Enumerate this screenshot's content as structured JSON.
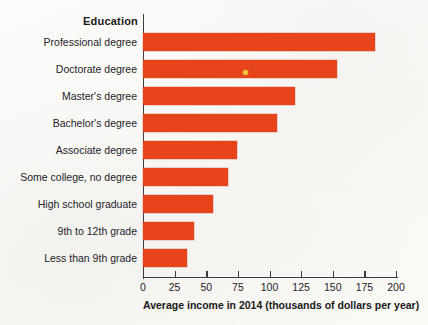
{
  "chart_data": {
    "type": "bar",
    "orientation": "horizontal",
    "title": "",
    "category_axis_header": "Education",
    "xlabel": "Average income in 2014 (thousands of dollars per year)",
    "ylabel": "Education",
    "xlim": [
      0,
      200
    ],
    "xticks": [
      0,
      25,
      50,
      75,
      100,
      125,
      150,
      175,
      200
    ],
    "xtick_labels": [
      "0",
      "25",
      "50",
      "75",
      "100",
      "125",
      "150",
      "175",
      "200"
    ],
    "grid": false,
    "legend": null,
    "bar_color": "#E8441C",
    "categories": [
      "Professional degree",
      "Doctorate degree",
      "Master's degree",
      "Bachelor's degree",
      "Associate degree",
      "Some college, no degree",
      "High school graduate",
      "9th to 12th grade",
      "Less than 9th grade"
    ],
    "values": [
      183,
      153,
      120,
      106,
      74,
      67,
      55,
      40,
      35
    ],
    "units": "thousands of dollars per year"
  },
  "artifacts": {
    "speck_name": "scan-speck"
  }
}
